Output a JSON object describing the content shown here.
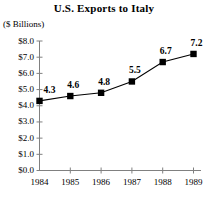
{
  "chart_data": {
    "type": "line",
    "title": "U.S. Exports to Italy",
    "ylabel": "($ Billions)",
    "xlabel": "",
    "categories": [
      "1984",
      "1985",
      "1986",
      "1987",
      "1988",
      "1989"
    ],
    "values": [
      4.3,
      4.6,
      4.8,
      5.5,
      6.7,
      7.2
    ],
    "point_labels": [
      "4.3",
      "4.6",
      "4.8",
      "5.5",
      "6.7",
      "7.2"
    ],
    "ylim": [
      0,
      8
    ],
    "ytick_values": [
      8.0,
      7.0,
      6.0,
      5.0,
      4.0,
      3.0,
      2.0,
      1.0,
      0.0
    ],
    "ytick_labels": [
      "$8.0",
      "$7.0",
      "$6.0",
      "$5.0",
      "$4.0",
      "$3.0",
      "$2.0",
      "$1.0",
      "$0.0"
    ],
    "grid": false,
    "legend": "none",
    "marker": "square",
    "series_color": "#000000",
    "axis_color": "#808080"
  }
}
